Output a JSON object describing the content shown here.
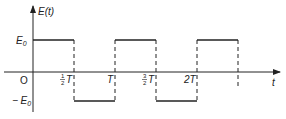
{
  "diagram": {
    "type": "square-wave",
    "y_axis_label": "E(t)",
    "x_axis_label": "t",
    "origin_label": "O",
    "level_high_label": "E",
    "level_high_sub": "0",
    "level_low_label": "− E",
    "level_low_sub": "0",
    "tick_labels": [
      {
        "num": "1",
        "den": "2",
        "sym": "T"
      },
      {
        "num": "",
        "den": "",
        "sym": "T"
      },
      {
        "num": "3",
        "den": "2",
        "sym": "T"
      },
      {
        "num": "",
        "den": "",
        "sym": "2T"
      }
    ],
    "colors": {
      "line": "#222222",
      "background": "#ffffff"
    }
  }
}
